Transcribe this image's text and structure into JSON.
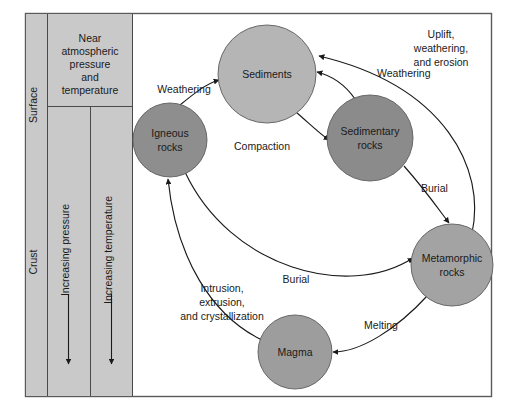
{
  "figure": {
    "kind": "rock-cycle-diagram",
    "background_color": "#ffffff",
    "frame_color": "#4d4d4d",
    "panel_color": "#c9c9c9",
    "line_color": "#1a1a1a"
  },
  "left_panel": {
    "depth_zones": [
      {
        "id": "surface",
        "label": "Surface"
      },
      {
        "id": "crust",
        "label": "Crust"
      }
    ],
    "condition_note": "Near atmospheric pressure and temperature",
    "condition_note_lines": [
      "Near",
      "atmospheric",
      "pressure",
      "and",
      "temperature"
    ],
    "gradients": [
      {
        "id": "pressure",
        "label": "Increasing pressure",
        "direction": "down"
      },
      {
        "id": "temperature",
        "label": "Increasing temperature",
        "direction": "down"
      }
    ]
  },
  "nodes": [
    {
      "id": "igneous",
      "label": "Igneous rocks",
      "lines": [
        "Igneous",
        "rocks"
      ],
      "cx": 170,
      "cy": 140,
      "r": 37,
      "fill": "#8e8e8e"
    },
    {
      "id": "sediments",
      "label": "Sediments",
      "lines": [
        "Sediments"
      ],
      "cx": 267,
      "cy": 74,
      "r": 49,
      "fill": "#b5b5b5"
    },
    {
      "id": "sedimentary",
      "label": "Sedimentary rocks",
      "lines": [
        "Sedimentary",
        "rocks"
      ],
      "cx": 370,
      "cy": 138,
      "r": 43,
      "fill": "#8b8b8b"
    },
    {
      "id": "metamorphic",
      "label": "Metamorphic rocks",
      "lines": [
        "Metamorphic",
        "rocks"
      ],
      "cx": 452,
      "cy": 265,
      "r": 41,
      "fill": "#a3a3a3"
    },
    {
      "id": "magma",
      "label": "Magma",
      "lines": [
        "Magma"
      ],
      "cx": 295,
      "cy": 352,
      "r": 37,
      "fill": "#9d9d9d"
    }
  ],
  "edges": [
    {
      "id": "igneous-to-sediments",
      "label": "Weathering",
      "lines": [
        "Weathering"
      ],
      "from": "igneous",
      "to": "sediments",
      "label_x": 184,
      "label_y": 93
    },
    {
      "id": "sedimentary-to-sediments",
      "label": "Weathering",
      "lines": [
        "Weathering"
      ],
      "from": "sedimentary",
      "to": "sediments",
      "label_x": 375,
      "label_y": 75
    },
    {
      "id": "sediments-to-sedimentary",
      "label": "Compaction",
      "lines": [
        "Compaction"
      ],
      "from": "sediments",
      "to": "sedimentary",
      "label_x": 262,
      "label_y": 147
    },
    {
      "id": "sedimentary-to-metamorphic",
      "label": "Burial",
      "lines": [
        "Burial"
      ],
      "from": "sedimentary",
      "to": "metamorphic",
      "label_x": 424,
      "label_y": 190
    },
    {
      "id": "igneous-to-metamorphic",
      "label": "Burial",
      "lines": [
        "Burial"
      ],
      "from": "igneous",
      "to": "metamorphic",
      "label_x": 296,
      "label_y": 281
    },
    {
      "id": "metamorphic-to-magma",
      "label": "Melting",
      "lines": [
        "Melting"
      ],
      "from": "metamorphic",
      "to": "magma",
      "label_x": 381,
      "label_y": 327
    },
    {
      "id": "magma-to-igneous",
      "label": "Intrusion, extrusion, and crystallization",
      "lines": [
        "Intrusion,",
        "extrusion,",
        "and crystallization"
      ],
      "from": "magma",
      "to": "igneous",
      "label_x": 210,
      "label_y": 295
    },
    {
      "id": "metamorphic-to-sediments",
      "label": "Uplift, weathering, and erosion",
      "lines": [
        "Uplift,",
        "weathering,",
        "and erosion"
      ],
      "from": "metamorphic",
      "to": "sediments",
      "label_x": 444,
      "label_y": 36
    }
  ]
}
